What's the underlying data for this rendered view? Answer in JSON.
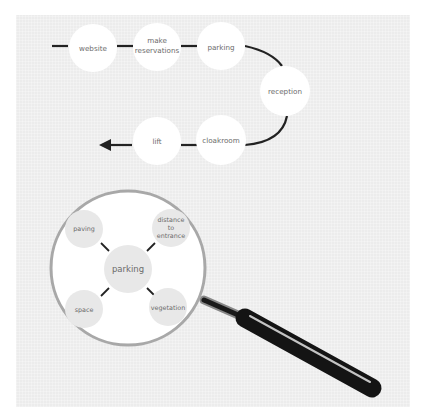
{
  "journey": {
    "steps": [
      {
        "id": "website",
        "label": "website"
      },
      {
        "id": "make-reservations",
        "label_line1": "make",
        "label_line2": "reservations"
      },
      {
        "id": "parking",
        "label": "parking"
      },
      {
        "id": "reception",
        "label": "reception"
      },
      {
        "id": "cloakroom",
        "label": "cloakroom"
      },
      {
        "id": "lift",
        "label": "lift"
      }
    ]
  },
  "magnifier": {
    "center": {
      "label": "parking"
    },
    "aspects": [
      {
        "id": "paving",
        "label": "paving"
      },
      {
        "id": "distance-to-entrance",
        "label_line1": "distance",
        "label_line2": "to",
        "label_line3": "entrance"
      },
      {
        "id": "space",
        "label": "space"
      },
      {
        "id": "vegetation",
        "label": "vegetation"
      }
    ]
  },
  "colors": {
    "panel": "#ececec",
    "node": "#ffffff",
    "aspect_node": "#e8e8e8",
    "line": "#222222",
    "lens_rim": "#a8a8a8",
    "handle": "#141414",
    "text": "#6b6b6b"
  }
}
